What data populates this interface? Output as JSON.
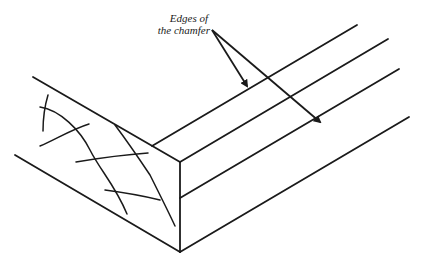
{
  "diagram": {
    "type": "technical-illustration",
    "annotation": {
      "line1": "Edges of",
      "line2": "the chamfer",
      "arrow_count": 2
    },
    "colors": {
      "stroke": "#1a1a1a",
      "background": "#ffffff"
    }
  }
}
